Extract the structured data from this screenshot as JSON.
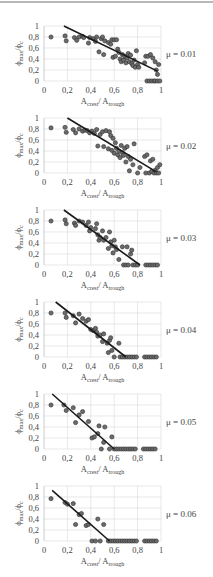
{
  "figure": {
    "x_axis_label_main": "A",
    "x_axis_label_sub1": "crest",
    "x_axis_label_sep": "/ A",
    "x_axis_label_sub2": "trough",
    "y_axis_label_main": "ϕ",
    "y_axis_label_sub1": "max",
    "y_axis_label_sep": "/ϕ",
    "y_axis_label_sub2": "c",
    "x_ticks": [
      "0",
      "0,2",
      "0,4",
      "0,6",
      "0,8",
      "1"
    ],
    "y_ticks": [
      "0",
      "0,2",
      "0,4",
      "0,6",
      "0,8",
      "1"
    ],
    "colors": {
      "marker_fill": "#6b6b6b",
      "marker_edge": "#2e2e2e",
      "line": "#1a1a1a",
      "grid": "#d9d9d9",
      "axis": "#bfbfbf",
      "top_rule": "#b8b8b8"
    }
  },
  "chart_data": [
    {
      "type": "scatter",
      "title": "μ = 0.01",
      "xlabel": "Acrest/ Atrough",
      "ylabel": "ϕmax/ϕc",
      "xlim": [
        0,
        1
      ],
      "ylim": [
        0,
        1
      ],
      "grid": true,
      "trendline": {
        "x": [
          0.17,
          0.97
        ],
        "y": [
          1.0,
          0.18
        ]
      },
      "points": [
        [
          0.06,
          0.8
        ],
        [
          0.18,
          0.82
        ],
        [
          0.19,
          0.73
        ],
        [
          0.26,
          0.79
        ],
        [
          0.28,
          0.74
        ],
        [
          0.3,
          0.8
        ],
        [
          0.33,
          0.81
        ],
        [
          0.34,
          0.79
        ],
        [
          0.38,
          0.69
        ],
        [
          0.39,
          0.79
        ],
        [
          0.42,
          0.77
        ],
        [
          0.44,
          0.72
        ],
        [
          0.45,
          0.8
        ],
        [
          0.47,
          0.53
        ],
        [
          0.49,
          0.77
        ],
        [
          0.5,
          0.8
        ],
        [
          0.51,
          0.48
        ],
        [
          0.52,
          0.73
        ],
        [
          0.55,
          0.7
        ],
        [
          0.57,
          0.67
        ],
        [
          0.58,
          0.75
        ],
        [
          0.59,
          0.43
        ],
        [
          0.6,
          0.75
        ],
        [
          0.61,
          0.45
        ],
        [
          0.62,
          0.75
        ],
        [
          0.63,
          0.58
        ],
        [
          0.64,
          0.52
        ],
        [
          0.65,
          0.4
        ],
        [
          0.66,
          0.35
        ],
        [
          0.67,
          0.48
        ],
        [
          0.68,
          0.38
        ],
        [
          0.69,
          0.45
        ],
        [
          0.7,
          0.33
        ],
        [
          0.71,
          0.42
        ],
        [
          0.72,
          0.5
        ],
        [
          0.73,
          0.35
        ],
        [
          0.74,
          0.47
        ],
        [
          0.75,
          0.32
        ],
        [
          0.76,
          0.28
        ],
        [
          0.77,
          0.38
        ],
        [
          0.78,
          0.25
        ],
        [
          0.79,
          0.55
        ],
        [
          0.8,
          0.3
        ],
        [
          0.81,
          0.25
        ],
        [
          0.86,
          0.33
        ],
        [
          0.87,
          0.45
        ],
        [
          0.88,
          0.0
        ],
        [
          0.89,
          0.45
        ],
        [
          0.9,
          0.0
        ],
        [
          0.91,
          0.48
        ],
        [
          0.92,
          0.0
        ],
        [
          0.93,
          0.42
        ],
        [
          0.94,
          0.0
        ],
        [
          0.95,
          0.35
        ],
        [
          0.95,
          0.0
        ],
        [
          0.96,
          0.2
        ],
        [
          0.97,
          0.12
        ],
        [
          0.97,
          0.0
        ],
        [
          0.98,
          0.3
        ],
        [
          0.99,
          0.0
        ]
      ]
    },
    {
      "type": "scatter",
      "title": "μ = 0.02",
      "xlabel": "Acrest/ Atrough",
      "ylabel": "ϕmax/ϕc",
      "xlim": [
        0,
        1
      ],
      "ylim": [
        0,
        1
      ],
      "grid": true,
      "trendline": {
        "x": [
          0.2,
          0.96
        ],
        "y": [
          1.0,
          0.02
        ]
      },
      "points": [
        [
          0.06,
          0.82
        ],
        [
          0.18,
          0.83
        ],
        [
          0.19,
          0.74
        ],
        [
          0.25,
          0.79
        ],
        [
          0.27,
          0.73
        ],
        [
          0.3,
          0.8
        ],
        [
          0.33,
          0.76
        ],
        [
          0.35,
          0.78
        ],
        [
          0.37,
          0.77
        ],
        [
          0.39,
          0.73
        ],
        [
          0.41,
          0.76
        ],
        [
          0.43,
          0.72
        ],
        [
          0.45,
          0.79
        ],
        [
          0.46,
          0.49
        ],
        [
          0.48,
          0.7
        ],
        [
          0.5,
          0.75
        ],
        [
          0.51,
          0.48
        ],
        [
          0.53,
          0.77
        ],
        [
          0.55,
          0.44
        ],
        [
          0.56,
          0.75
        ],
        [
          0.57,
          0.68
        ],
        [
          0.58,
          0.41
        ],
        [
          0.59,
          0.63
        ],
        [
          0.6,
          0.36
        ],
        [
          0.61,
          0.55
        ],
        [
          0.62,
          0.45
        ],
        [
          0.63,
          0.33
        ],
        [
          0.64,
          0.4
        ],
        [
          0.65,
          0.28
        ],
        [
          0.66,
          0.5
        ],
        [
          0.67,
          0.37
        ],
        [
          0.68,
          0.32
        ],
        [
          0.69,
          0.45
        ],
        [
          0.7,
          0.2
        ],
        [
          0.71,
          0.48
        ],
        [
          0.72,
          0.3
        ],
        [
          0.73,
          0.04
        ],
        [
          0.74,
          0.25
        ],
        [
          0.76,
          0.15
        ],
        [
          0.77,
          0.53
        ],
        [
          0.8,
          0.0
        ],
        [
          0.82,
          0.1
        ],
        [
          0.86,
          0.3
        ],
        [
          0.87,
          0.0
        ],
        [
          0.88,
          0.33
        ],
        [
          0.9,
          0.0
        ],
        [
          0.91,
          0.22
        ],
        [
          0.92,
          0.03
        ],
        [
          0.93,
          0.25
        ],
        [
          0.94,
          0.0
        ],
        [
          0.95,
          0.05
        ],
        [
          0.96,
          0.0
        ],
        [
          0.97,
          0.1
        ],
        [
          0.98,
          0.0
        ],
        [
          0.99,
          0.15
        ]
      ]
    },
    {
      "type": "scatter",
      "title": "μ = 0.03",
      "xlabel": "Acrest/ Atrough",
      "ylabel": "ϕmax/ϕc",
      "xlim": [
        0,
        1
      ],
      "ylim": [
        0,
        1
      ],
      "grid": true,
      "trendline": {
        "x": [
          0.17,
          0.82
        ],
        "y": [
          1.0,
          0.0
        ]
      },
      "points": [
        [
          0.06,
          0.8
        ],
        [
          0.18,
          0.82
        ],
        [
          0.19,
          0.75
        ],
        [
          0.26,
          0.76
        ],
        [
          0.27,
          0.72
        ],
        [
          0.3,
          0.8
        ],
        [
          0.33,
          0.78
        ],
        [
          0.36,
          0.72
        ],
        [
          0.38,
          0.78
        ],
        [
          0.39,
          0.62
        ],
        [
          0.4,
          0.68
        ],
        [
          0.44,
          0.66
        ],
        [
          0.45,
          0.75
        ],
        [
          0.46,
          0.55
        ],
        [
          0.47,
          0.45
        ],
        [
          0.48,
          0.5
        ],
        [
          0.5,
          0.62
        ],
        [
          0.51,
          0.45
        ],
        [
          0.53,
          0.5
        ],
        [
          0.55,
          0.3
        ],
        [
          0.56,
          0.6
        ],
        [
          0.57,
          0.42
        ],
        [
          0.58,
          0.35
        ],
        [
          0.59,
          0.22
        ],
        [
          0.6,
          0.45
        ],
        [
          0.61,
          0.33
        ],
        [
          0.62,
          0.28
        ],
        [
          0.64,
          0.1
        ],
        [
          0.67,
          0.33
        ],
        [
          0.68,
          0.0
        ],
        [
          0.7,
          0.0
        ],
        [
          0.71,
          0.33
        ],
        [
          0.72,
          0.0
        ],
        [
          0.74,
          0.2
        ],
        [
          0.75,
          0.27
        ],
        [
          0.76,
          0.0
        ],
        [
          0.78,
          0.0
        ],
        [
          0.8,
          0.0
        ],
        [
          0.87,
          0.0
        ],
        [
          0.89,
          0.0
        ],
        [
          0.91,
          0.0
        ],
        [
          0.93,
          0.0
        ],
        [
          0.95,
          0.0
        ],
        [
          0.97,
          0.0
        ]
      ]
    },
    {
      "type": "scatter",
      "title": "μ = 0.04",
      "xlabel": "Acrest/ Atrough",
      "ylabel": "ϕmax/ϕc",
      "xlim": [
        0,
        1
      ],
      "ylim": [
        0,
        1
      ],
      "grid": true,
      "trendline": {
        "x": [
          0.1,
          0.7
        ],
        "y": [
          1.0,
          0.0
        ]
      },
      "points": [
        [
          0.06,
          0.8
        ],
        [
          0.18,
          0.8
        ],
        [
          0.19,
          0.72
        ],
        [
          0.25,
          0.75
        ],
        [
          0.27,
          0.62
        ],
        [
          0.3,
          0.78
        ],
        [
          0.33,
          0.7
        ],
        [
          0.36,
          0.65
        ],
        [
          0.38,
          0.68
        ],
        [
          0.4,
          0.5
        ],
        [
          0.42,
          0.48
        ],
        [
          0.44,
          0.52
        ],
        [
          0.45,
          0.45
        ],
        [
          0.46,
          0.38
        ],
        [
          0.48,
          0.4
        ],
        [
          0.5,
          0.28
        ],
        [
          0.51,
          0.42
        ],
        [
          0.54,
          0.25
        ],
        [
          0.55,
          0.08
        ],
        [
          0.56,
          0.3
        ],
        [
          0.57,
          0.35
        ],
        [
          0.58,
          0.12
        ],
        [
          0.6,
          0.0
        ],
        [
          0.64,
          0.25
        ],
        [
          0.65,
          0.0
        ],
        [
          0.67,
          0.0
        ],
        [
          0.69,
          0.0
        ],
        [
          0.71,
          0.0
        ],
        [
          0.73,
          0.0
        ],
        [
          0.75,
          0.0
        ],
        [
          0.77,
          0.0
        ],
        [
          0.79,
          0.0
        ],
        [
          0.86,
          0.0
        ],
        [
          0.88,
          0.0
        ],
        [
          0.9,
          0.0
        ],
        [
          0.92,
          0.0
        ],
        [
          0.94,
          0.0
        ],
        [
          0.96,
          0.0
        ]
      ]
    },
    {
      "type": "scatter",
      "title": "μ = 0.05",
      "xlabel": "Acrest/ Atrough",
      "ylabel": "ϕmax/ϕc",
      "xlim": [
        0,
        1
      ],
      "ylim": [
        0,
        1
      ],
      "grid": true,
      "trendline": {
        "x": [
          0.07,
          0.6
        ],
        "y": [
          1.0,
          0.0
        ]
      },
      "points": [
        [
          0.06,
          0.8
        ],
        [
          0.17,
          0.8
        ],
        [
          0.19,
          0.7
        ],
        [
          0.25,
          0.75
        ],
        [
          0.27,
          0.48
        ],
        [
          0.3,
          0.62
        ],
        [
          0.33,
          0.68
        ],
        [
          0.38,
          0.5
        ],
        [
          0.41,
          0.2
        ],
        [
          0.43,
          0.22
        ],
        [
          0.46,
          0.28
        ],
        [
          0.47,
          0.42
        ],
        [
          0.49,
          0.0
        ],
        [
          0.51,
          0.12
        ],
        [
          0.52,
          0.4
        ],
        [
          0.56,
          0.0
        ],
        [
          0.58,
          0.22
        ],
        [
          0.6,
          0.0
        ],
        [
          0.62,
          0.0
        ],
        [
          0.64,
          0.0
        ],
        [
          0.66,
          0.0
        ],
        [
          0.68,
          0.0
        ],
        [
          0.7,
          0.0
        ],
        [
          0.72,
          0.0
        ],
        [
          0.74,
          0.0
        ],
        [
          0.76,
          0.0
        ],
        [
          0.78,
          0.0
        ],
        [
          0.85,
          0.0
        ],
        [
          0.87,
          0.0
        ],
        [
          0.89,
          0.0
        ],
        [
          0.91,
          0.0
        ],
        [
          0.93,
          0.0
        ],
        [
          0.95,
          0.0
        ]
      ]
    },
    {
      "type": "scatter",
      "title": "μ = 0.06",
      "xlabel": "Acrest/ Atrough",
      "ylabel": "ϕmax/ϕc",
      "xlim": [
        0,
        1
      ],
      "ylim": [
        0,
        1
      ],
      "grid": true,
      "trendline": {
        "x": [
          0.07,
          0.56
        ],
        "y": [
          0.92,
          0.0
        ]
      },
      "points": [
        [
          0.06,
          0.77
        ],
        [
          0.18,
          0.7
        ],
        [
          0.2,
          0.67
        ],
        [
          0.25,
          0.68
        ],
        [
          0.27,
          0.3
        ],
        [
          0.3,
          0.48
        ],
        [
          0.32,
          0.5
        ],
        [
          0.36,
          0.28
        ],
        [
          0.38,
          0.3
        ],
        [
          0.41,
          0.0
        ],
        [
          0.44,
          0.0
        ],
        [
          0.46,
          0.4
        ],
        [
          0.48,
          0.0
        ],
        [
          0.51,
          0.3
        ],
        [
          0.55,
          0.0
        ],
        [
          0.57,
          0.0
        ],
        [
          0.59,
          0.0
        ],
        [
          0.61,
          0.0
        ],
        [
          0.63,
          0.0
        ],
        [
          0.65,
          0.0
        ],
        [
          0.67,
          0.0
        ],
        [
          0.69,
          0.0
        ],
        [
          0.71,
          0.0
        ],
        [
          0.73,
          0.0
        ],
        [
          0.75,
          0.0
        ],
        [
          0.77,
          0.0
        ],
        [
          0.79,
          0.0
        ],
        [
          0.86,
          0.0
        ],
        [
          0.88,
          0.0
        ],
        [
          0.9,
          0.0
        ],
        [
          0.92,
          0.0
        ],
        [
          0.94,
          0.0
        ],
        [
          0.96,
          0.0
        ]
      ]
    }
  ]
}
